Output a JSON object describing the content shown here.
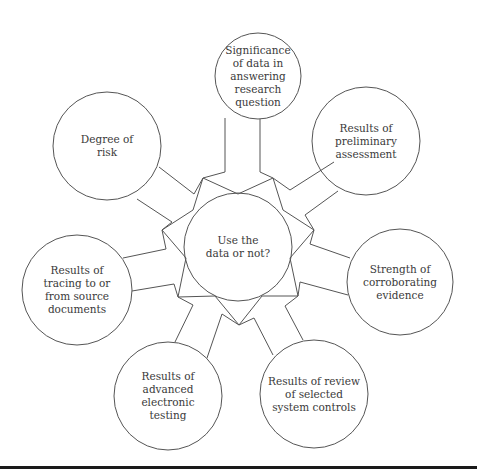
{
  "diagram": {
    "type": "hub-and-spoke",
    "line_color": "#555555",
    "text_color": "#3a3a3a",
    "center": {
      "label": "Use the\ndata or not?",
      "cx": 238,
      "cy": 247,
      "r": 54
    },
    "nodes": [
      {
        "id": "significance",
        "label": "Significance\nof data in\nanswering\nresearch\nquestion",
        "cx": 258,
        "cy": 76,
        "r": 43
      },
      {
        "id": "preliminary",
        "label": "Results of\npreliminary\nassessment",
        "cx": 366,
        "cy": 141,
        "r": 54
      },
      {
        "id": "corroborating",
        "label": "Strength of\ncorroborating\nevidence",
        "cx": 400,
        "cy": 282,
        "r": 53
      },
      {
        "id": "system-controls",
        "label": "Results of review\nof selected\nsystem controls",
        "cx": 314,
        "cy": 394,
        "r": 54
      },
      {
        "id": "electronic-testing",
        "label": "Results of\nadvanced\nelectronic\ntesting",
        "cx": 168,
        "cy": 396,
        "r": 54
      },
      {
        "id": "tracing",
        "label": "Results of\ntracing to or\nfrom source\ndocuments",
        "cx": 77,
        "cy": 290,
        "r": 55
      },
      {
        "id": "risk",
        "label": "Degree of\nrisk",
        "cx": 107,
        "cy": 146,
        "r": 54
      }
    ],
    "star_points": [
      [
        203,
        178
      ],
      [
        238,
        194
      ],
      [
        273,
        178
      ],
      [
        283,
        210
      ],
      [
        314,
        230
      ],
      [
        290,
        258
      ],
      [
        298,
        296
      ],
      [
        262,
        296
      ],
      [
        239,
        325
      ],
      [
        215,
        296
      ],
      [
        178,
        297
      ],
      [
        186,
        258
      ],
      [
        162,
        230
      ],
      [
        193,
        210
      ]
    ],
    "spokes": [
      {
        "node": "significance",
        "paths": [
          [
            [
              203,
              178
            ],
            [
              225,
              172
            ],
            [
              225,
              118
            ]
          ],
          [
            [
              273,
              178
            ],
            [
              260,
              172
            ],
            [
              260,
              119
            ]
          ]
        ]
      },
      {
        "node": "preliminary",
        "paths": [
          [
            [
              273,
              178
            ],
            [
              290,
              190
            ],
            [
              334,
              162
            ]
          ],
          [
            [
              314,
              230
            ],
            [
              305,
              215
            ],
            [
              338,
              191
            ]
          ]
        ]
      },
      {
        "node": "corroborating",
        "paths": [
          [
            [
              314,
              230
            ],
            [
              310,
              244
            ],
            [
              350,
              258
            ]
          ],
          [
            [
              298,
              296
            ],
            [
              300,
              282
            ],
            [
              348,
              295
            ]
          ]
        ]
      },
      {
        "node": "system-controls",
        "paths": [
          [
            [
              298,
              296
            ],
            [
              285,
              306
            ],
            [
              303,
              340
            ]
          ],
          [
            [
              239,
              325
            ],
            [
              254,
              318
            ],
            [
              273,
              355
            ]
          ]
        ]
      },
      {
        "node": "electronic-testing",
        "paths": [
          [
            [
              239,
              325
            ],
            [
              222,
              314
            ],
            [
              207,
              358
            ]
          ],
          [
            [
              178,
              297
            ],
            [
              193,
              305
            ],
            [
              175,
              342
            ]
          ]
        ]
      },
      {
        "node": "tracing",
        "paths": [
          [
            [
              178,
              297
            ],
            [
              174,
              284
            ],
            [
              132,
              291
            ]
          ],
          [
            [
              162,
              230
            ],
            [
              166,
              249
            ],
            [
              123,
              258
            ]
          ]
        ]
      },
      {
        "node": "risk",
        "paths": [
          [
            [
              162,
              230
            ],
            [
              172,
              222
            ],
            [
              137,
              199
            ]
          ],
          [
            [
              203,
              178
            ],
            [
              194,
              194
            ],
            [
              159,
              167
            ]
          ]
        ]
      }
    ]
  }
}
